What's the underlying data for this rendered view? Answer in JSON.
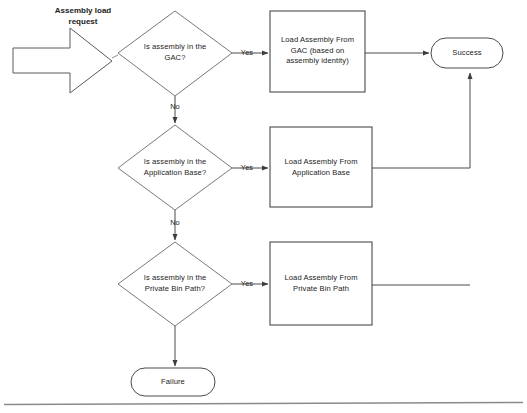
{
  "diagram": {
    "background_color": "#ffffff",
    "stroke_color": "#4a4a4a",
    "text_color": "#1b1b1b"
  },
  "start": {
    "label": "Assembly load\nrequest",
    "shape": "block-arrow"
  },
  "decisions": [
    {
      "id": "gac",
      "label": "Is assembly in the\nGAC?",
      "yes_label": "Yes",
      "no_label": "No"
    },
    {
      "id": "appbase",
      "label": "Is assembly in the\nApplication Base?",
      "yes_label": "Yes",
      "no_label": "No"
    },
    {
      "id": "privatebin",
      "label": "Is assembly in the\nPrivate Bin Path?",
      "yes_label": "Yes",
      "no_label": ""
    }
  ],
  "processes": [
    {
      "id": "load-gac",
      "label": "Load Assembly From\nGAC (based on\nassembly identity)"
    },
    {
      "id": "load-appbase",
      "label": "Load Assembly From\nApplication Base"
    },
    {
      "id": "load-privatebin",
      "label": "Load Assembly From\nPrivate Bin Path"
    }
  ],
  "terminators": [
    {
      "id": "success",
      "label": "Success"
    },
    {
      "id": "failure",
      "label": "Failure"
    }
  ]
}
